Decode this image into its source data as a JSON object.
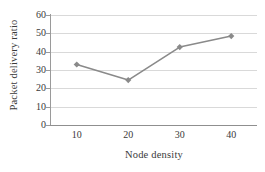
{
  "chart_data": {
    "type": "line",
    "title": "",
    "xlabel": "Node density",
    "ylabel": "Packet  delivery ratio",
    "x": [
      10,
      20,
      30,
      40
    ],
    "xticklabels": [
      "10",
      "20",
      "30",
      "40"
    ],
    "yticklabels": [
      "0",
      "10",
      "20",
      "30",
      "40",
      "50",
      "60"
    ],
    "yticks": [
      0,
      10,
      20,
      30,
      40,
      50,
      60
    ],
    "xlim": [
      5,
      45
    ],
    "ylim": [
      0,
      60
    ],
    "grid": "horizontal",
    "legend": "none",
    "series": [
      {
        "name": "Packet delivery ratio",
        "values": [
          33,
          24.5,
          42.5,
          48.5
        ],
        "color": "#8a8a8a",
        "marker": "diamond"
      }
    ]
  },
  "colors": {
    "series_line": "#8a8a8a",
    "marker": "#8a8a8a",
    "gridline": "#d9d9d9",
    "axis": "#9a9a9a",
    "text": "#3a3a3a",
    "background": "#ffffff"
  }
}
